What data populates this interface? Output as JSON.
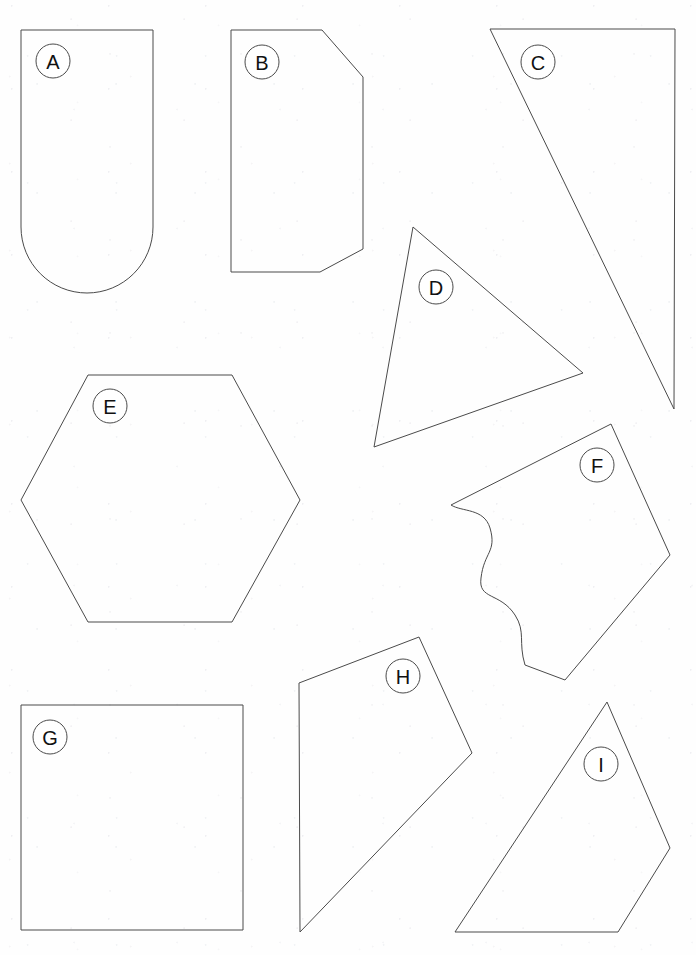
{
  "page": {
    "width": 696,
    "height": 955,
    "background_color": "#fefefe",
    "stroke_color": "#4a4a4a",
    "label_text_color": "#111111",
    "label_circle_fill": "#ffffff",
    "stroke_width": 1,
    "label_radius": 17
  },
  "shapes": [
    {
      "id": "shape-a",
      "label": "A",
      "kind": "rounded-bottom-rectangle",
      "label_center": {
        "x": 53,
        "y": 61
      },
      "path": "M 21 30 L 21 227 A 66 66 0 0 0 153 227 L 153 30 Z",
      "bounds": {
        "x": 21,
        "y": 30,
        "width": 132,
        "height": 263
      }
    },
    {
      "id": "shape-b",
      "label": "B",
      "kind": "cut-corner-hexagon",
      "label_center": {
        "x": 262,
        "y": 62
      },
      "points": "231,30 322,30 363,77 363,249 320,272 231,272",
      "bounds": {
        "x": 231,
        "y": 30,
        "width": 132,
        "height": 242
      }
    },
    {
      "id": "shape-c",
      "label": "C",
      "kind": "triangle",
      "label_center": {
        "x": 538,
        "y": 62
      },
      "points": "490,29 675,29 674,409",
      "bounds": {
        "x": 490,
        "y": 29,
        "width": 185,
        "height": 380
      }
    },
    {
      "id": "shape-d",
      "label": "D",
      "kind": "triangle",
      "label_center": {
        "x": 436,
        "y": 287
      },
      "points": "413,227 583,373 374,447",
      "bounds": {
        "x": 374,
        "y": 227,
        "width": 209,
        "height": 220
      }
    },
    {
      "id": "shape-e",
      "label": "E",
      "kind": "hexagon",
      "label_center": {
        "x": 110,
        "y": 406
      },
      "points": "88,375 232,375 300,500 232,622 88,622 21,500",
      "bounds": {
        "x": 21,
        "y": 375,
        "width": 279,
        "height": 247
      }
    },
    {
      "id": "shape-f",
      "label": "F",
      "kind": "irregular-wavy-polygon",
      "label_center": {
        "x": 597,
        "y": 465
      },
      "path": "M 611 424 L 670 555 L 565 680 L 525 665 C 518 642 526 632 515 615 C 500 592 478 600 481 578 C 484 552 497 552 490 528 C 484 508 462 512 451 505 Z",
      "bounds": {
        "x": 451,
        "y": 424,
        "width": 219,
        "height": 256
      }
    },
    {
      "id": "shape-g",
      "label": "G",
      "kind": "square",
      "label_center": {
        "x": 50,
        "y": 737
      },
      "points": "21,705 243,705 243,930 21,930",
      "bounds": {
        "x": 21,
        "y": 705,
        "width": 222,
        "height": 225
      }
    },
    {
      "id": "shape-h",
      "label": "H",
      "kind": "quadrilateral",
      "label_center": {
        "x": 403,
        "y": 676
      },
      "points": "419,637 472,753 300,932 299,683",
      "bounds": {
        "x": 299,
        "y": 637,
        "width": 173,
        "height": 295
      }
    },
    {
      "id": "shape-i",
      "label": "I",
      "kind": "quadrilateral",
      "label_center": {
        "x": 601,
        "y": 764
      },
      "points": "607,702 670,848 618,932 455,932",
      "bounds": {
        "x": 455,
        "y": 702,
        "width": 215,
        "height": 230
      }
    }
  ]
}
